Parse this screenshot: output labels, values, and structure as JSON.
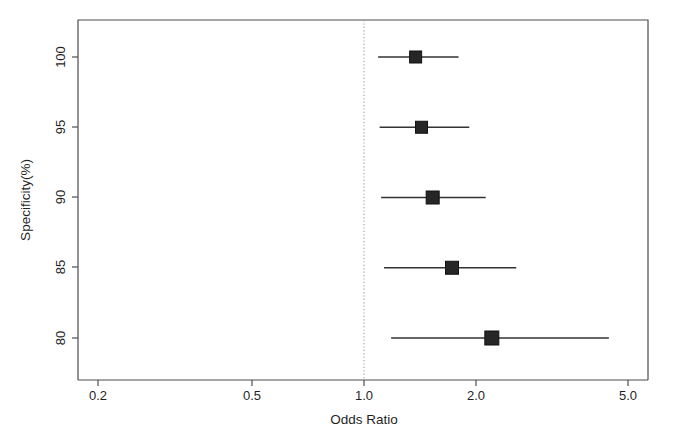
{
  "chart_data": {
    "type": "scatter",
    "title": "",
    "xlabel": "Odds Ratio",
    "ylabel": "Specificity(%)",
    "xscale": "log",
    "xlim": [
      0.2,
      5.0
    ],
    "xticks": [
      0.2,
      0.5,
      1.0,
      2.0,
      5.0
    ],
    "xticklabels": [
      "0.2",
      "0.5",
      "1.0",
      "2.0",
      "5.0"
    ],
    "ylim": [
      78,
      102.5
    ],
    "yticks": [
      80,
      85,
      90,
      95,
      100
    ],
    "yticklabels": [
      "80",
      "95",
      "90",
      "95",
      "100"
    ],
    "grid": false,
    "legend": null,
    "reference_line": {
      "value": 1.0,
      "style": "dotted",
      "color": "#9a9a9a"
    },
    "marker": "filled-square",
    "errorbar": "horizontal-ci",
    "categories": [
      "100",
      "95",
      "90",
      "85",
      "80"
    ],
    "points": [
      {
        "specificity": 100,
        "odds_ratio": 1.37,
        "ci_low": 1.09,
        "ci_high": 1.78,
        "marker_size": 12
      },
      {
        "specificity": 95,
        "odds_ratio": 1.42,
        "ci_low": 1.1,
        "ci_high": 1.9,
        "marker_size": 12
      },
      {
        "specificity": 90,
        "odds_ratio": 1.52,
        "ci_low": 1.11,
        "ci_high": 2.1,
        "marker_size": 13
      },
      {
        "specificity": 85,
        "odds_ratio": 1.71,
        "ci_low": 1.13,
        "ci_high": 2.53,
        "marker_size": 13
      },
      {
        "specificity": 80,
        "odds_ratio": 2.18,
        "ci_low": 1.18,
        "ci_high": 4.45,
        "marker_size": 14
      }
    ]
  },
  "axes": {
    "y_tick_labels": [
      "100",
      "95",
      "90",
      "85",
      "80"
    ],
    "x_tick_labels": [
      "0.2",
      "0.5",
      "1.0",
      "2.0",
      "5.0"
    ],
    "x_axis_title": "Odds Ratio",
    "y_axis_title": "Specificity(%)"
  },
  "colors": {
    "background": "#ffffff",
    "axis": "#4d4d4d",
    "marker": "#262626",
    "ci": "#333333",
    "reference": "#9a9a9a",
    "text": "#1f1f1f"
  }
}
